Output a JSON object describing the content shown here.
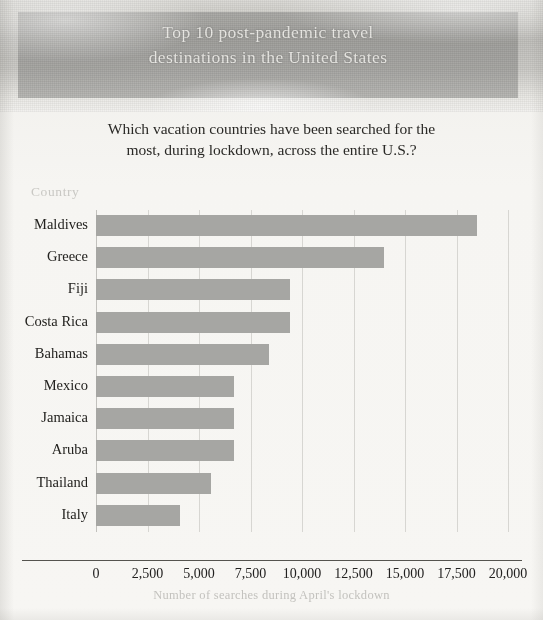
{
  "poster": {
    "title_line1": "Top 10 post-pandemic travel",
    "title_line2": "destinations in the United States",
    "subtitle_line1": "Which vacation countries have been searched for the",
    "subtitle_line2": "most, during lockdown, across the entire U.S.?",
    "banner_color": "#787876",
    "title_color": "#e9e8e4",
    "page_background": "#f3f2ef"
  },
  "chart_data": {
    "type": "bar",
    "orientation": "horizontal",
    "title": "Top 10 post-pandemic travel destinations in the United States",
    "subtitle": "Which vacation countries have been searched for the most, during lockdown, across the entire U.S.?",
    "xlabel": "Number of searches during April's lockdown",
    "ylabel": "Country",
    "categories": [
      "Maldives",
      "Greece",
      "Fiji",
      "Costa Rica",
      "Bahamas",
      "Mexico",
      "Jamaica",
      "Aruba",
      "Thailand",
      "Italy"
    ],
    "values": [
      18500,
      14000,
      9400,
      9400,
      8400,
      6700,
      6700,
      6700,
      5600,
      4100
    ],
    "xlim": [
      0,
      20000
    ],
    "xticks": [
      0,
      2500,
      5000,
      7500,
      10000,
      12500,
      15000,
      17500,
      20000
    ],
    "xtick_labels": [
      "0",
      "2,500",
      "5,000",
      "7,500",
      "10,000",
      "12,500",
      "15,000",
      "17,500",
      "20,000"
    ],
    "grid": true,
    "grid_axis": "x",
    "legend": false,
    "bar_color": "#a6a6a3",
    "gridline_color": "#d7d6d2",
    "axis_label_color": "#c9c8c4"
  }
}
